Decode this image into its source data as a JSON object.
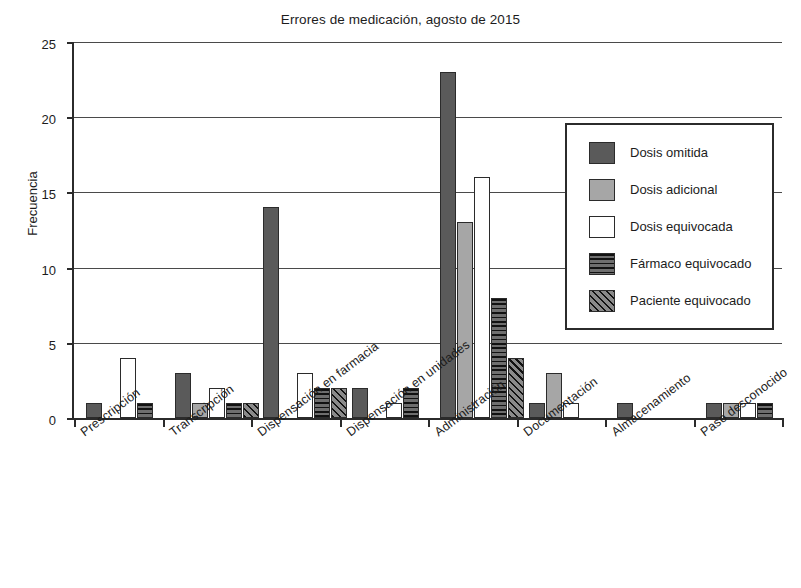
{
  "chart_data": {
    "type": "bar",
    "title": "Errores de medicación, agosto de 2015",
    "xlabel": "",
    "ylabel": "Frecuencia",
    "ylim": [
      0,
      25
    ],
    "yticks": [
      0,
      5,
      10,
      15,
      20,
      25
    ],
    "grid": true,
    "legend_position": "upper right",
    "categories": [
      "Prescripción",
      "Transcripción",
      "Dispensación en farmacia",
      "Dispensación en unidades",
      "Administración",
      "Documentación",
      "Almacenamiento",
      "Paso desconocido"
    ],
    "series": [
      {
        "name": "Dosis omitida",
        "fill": "solid-dark-gray",
        "color": "#5a5a5a",
        "values": [
          1,
          3,
          14,
          2,
          23,
          1,
          1,
          1
        ]
      },
      {
        "name": "Dosis adicional",
        "fill": "solid-medium-gray",
        "color": "#a6a6a6",
        "values": [
          0,
          1,
          0,
          0,
          13,
          3,
          0,
          1
        ]
      },
      {
        "name": "Dosis equivocada",
        "fill": "solid-white",
        "color": "#ffffff",
        "values": [
          4,
          2,
          3,
          1,
          16,
          1,
          0,
          1
        ]
      },
      {
        "name": "Fármaco equivocado",
        "fill": "horizontal-hatch",
        "color": "#6e6e6e",
        "values": [
          1,
          1,
          2,
          2,
          8,
          0,
          0,
          1
        ]
      },
      {
        "name": "Paciente equivocado",
        "fill": "diagonal-hatch",
        "color": "#8a8a8a",
        "values": [
          0,
          1,
          2,
          0,
          4,
          0,
          0,
          0
        ]
      }
    ]
  },
  "yticks_text": [
    "0",
    "5",
    "10",
    "15",
    "20",
    "25"
  ],
  "legend": {
    "items": [
      {
        "label": "Dosis omitida"
      },
      {
        "label": "Dosis adicional"
      },
      {
        "label": "Dosis equivocada"
      },
      {
        "label": "Fármaco equivocado"
      },
      {
        "label": "Paciente equivocado"
      }
    ]
  }
}
